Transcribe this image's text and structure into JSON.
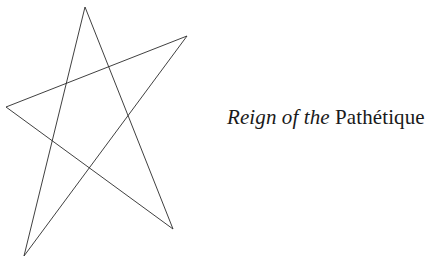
{
  "title": {
    "italic_part": "Reign of the",
    "roman_part": "Pathétique"
  },
  "figure": {
    "shape": "five-pointed star (pentagram)",
    "stroke_color": "#2a2a2a",
    "vertices": {
      "top": [
        85,
        7
      ],
      "right": [
        187,
        36
      ],
      "left": [
        6,
        107
      ],
      "bottom_right": [
        173,
        229
      ],
      "bottom_left": [
        24,
        256
      ]
    }
  }
}
